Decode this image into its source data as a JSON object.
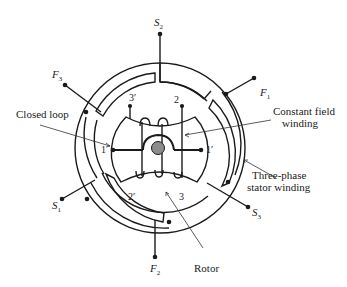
{
  "diagram": {
    "terminals": [
      {
        "id": "S2",
        "letter": "S",
        "sub": "2"
      },
      {
        "id": "F1",
        "letter": "F",
        "sub": "1"
      },
      {
        "id": "F3",
        "letter": "F",
        "sub": "3"
      },
      {
        "id": "S1",
        "letter": "S",
        "sub": "1"
      },
      {
        "id": "S3",
        "letter": "S",
        "sub": "3"
      },
      {
        "id": "F2",
        "letter": "F",
        "sub": "2"
      }
    ],
    "coil_sides": {
      "one": "1",
      "one_prime": "1′",
      "two": "2",
      "two_prime": "2′",
      "three": "3",
      "three_prime": "3′"
    },
    "labels": {
      "closed_loop": "Closed loop",
      "constant_field_line1": "Constant field",
      "constant_field_line2": "winding",
      "stator_line1": "Three-phase",
      "stator_line2": "stator winding",
      "rotor": "Rotor"
    },
    "colors": {
      "line": "#1a1a1a",
      "shaft": "#8c8c8c"
    }
  }
}
